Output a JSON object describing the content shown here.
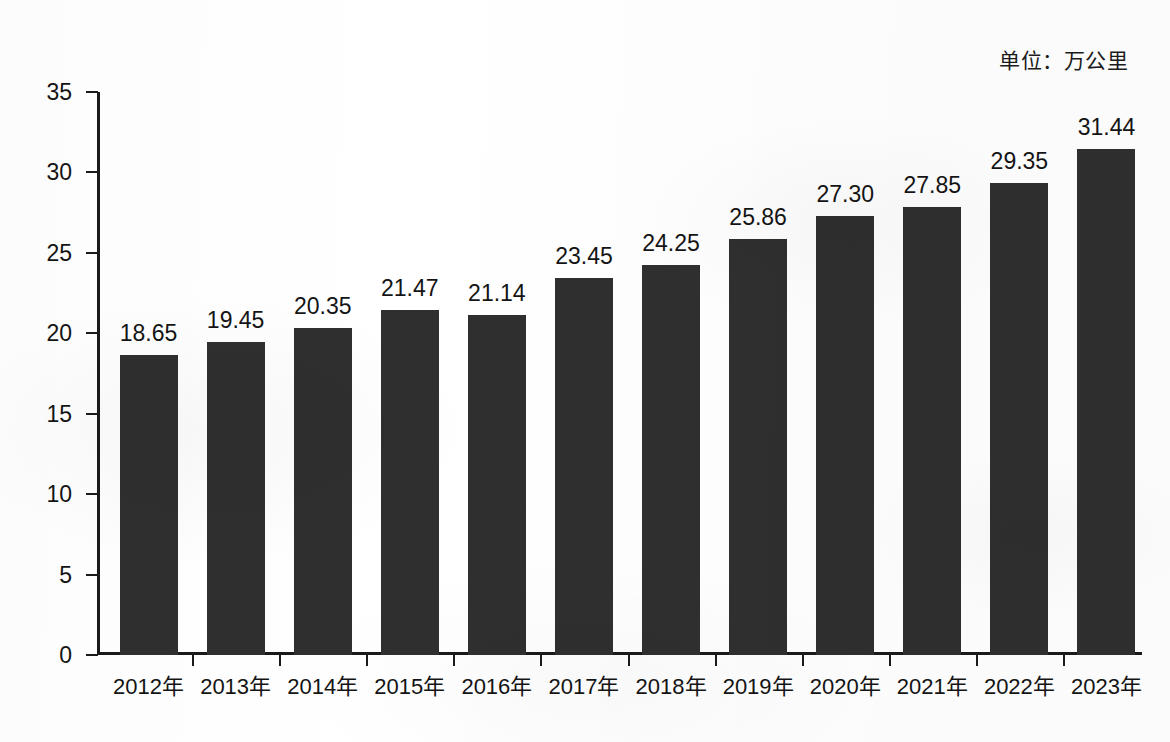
{
  "unit_caption": "单位：万公里",
  "chart_data": {
    "type": "bar",
    "title": "",
    "subtitle": "",
    "xlabel": "",
    "ylabel": "",
    "unit_note": "单位：万公里",
    "ylim": [
      0,
      35
    ],
    "ytick_labels": [
      "35",
      "30",
      "25",
      "20",
      "15",
      "10",
      "5",
      "0"
    ],
    "yticks": [
      35,
      30,
      25,
      20,
      15,
      10,
      5,
      0
    ],
    "grid": false,
    "legend": false,
    "legend_position": "none",
    "bar_color": "#2f2f2f",
    "axis_color": "#1a1a1a",
    "text_color": "#141414",
    "categories": [
      "2012年",
      "2013年",
      "2014年",
      "2015年",
      "2016年",
      "2017年",
      "2018年",
      "2019年",
      "2020年",
      "2021年",
      "2022年",
      "2023年"
    ],
    "values": [
      18.65,
      19.45,
      20.35,
      21.47,
      21.14,
      23.45,
      24.25,
      25.86,
      27.3,
      27.85,
      29.35,
      31.44
    ],
    "value_labels": [
      "18.65",
      "19.45",
      "20.35",
      "21.47",
      "21.14",
      "23.45",
      "24.25",
      "25.86",
      "27.30",
      "27.85",
      "29.35",
      "31.44"
    ]
  }
}
